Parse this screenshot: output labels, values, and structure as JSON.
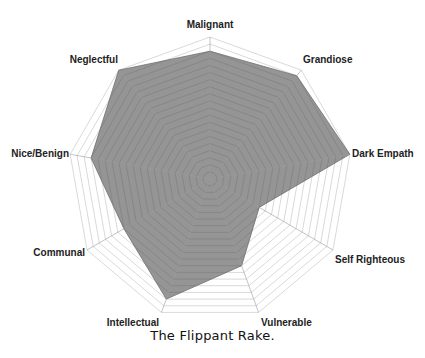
{
  "caption": "The Flippant Rake.",
  "colors": {
    "fill": "#8c8c8c",
    "fill_stroke": "#6e6e6e",
    "grid": "#c8c8c8",
    "background": "#ffffff",
    "label": "#222222"
  },
  "chart_data": {
    "type": "radar",
    "title": "The Flippant Rake.",
    "categories": [
      "Malignant",
      "Grandiose",
      "Dark Empath",
      "Self Righteous",
      "Vulnerable",
      "Intellectual",
      "Communal",
      "Nice/Benign",
      "Neglectful"
    ],
    "series": [
      {
        "name": "The Flippant Rake",
        "values": [
          18,
          19,
          20,
          8,
          13,
          18,
          14,
          17,
          20
        ]
      }
    ],
    "rlim": [
      0,
      20
    ],
    "grid_rings": 20,
    "grid": true,
    "legend": "none"
  }
}
